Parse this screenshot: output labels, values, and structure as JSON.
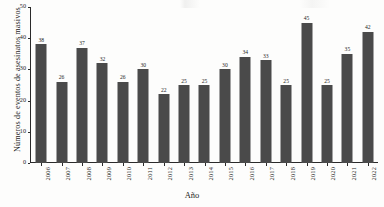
{
  "chart_data": {
    "type": "bar",
    "title": "",
    "xlabel": "Año",
    "ylabel": "Números de eventos de asesinatos masivos",
    "categories": [
      "2006",
      "2007",
      "2008",
      "2009",
      "2010",
      "2011",
      "2012",
      "2013",
      "2014",
      "2015",
      "2016",
      "2017",
      "2018",
      "2019",
      "2020",
      "2021",
      "2022"
    ],
    "values": [
      38,
      26,
      37,
      32,
      26,
      30,
      22,
      25,
      25,
      30,
      34,
      33,
      25,
      45,
      25,
      35,
      42
    ],
    "value_labels": [
      "38",
      "26",
      "37",
      "32",
      "26",
      "30",
      "22",
      "25",
      "25",
      "30",
      "34",
      "33",
      "25",
      "45",
      "25",
      "35",
      "42"
    ],
    "ylim": [
      0,
      50
    ],
    "yticks": [
      0,
      10,
      20,
      30,
      40,
      50
    ],
    "ytick_labels": [
      "0",
      "10",
      "20",
      "30",
      "40",
      "50"
    ],
    "grid": false,
    "legend": null,
    "bar_color": "#4a4a4a",
    "axis_color": "#2a2a2a",
    "background_color": "#fdfdfc",
    "show_value_labels": true,
    "xtick_rotation": 90
  }
}
